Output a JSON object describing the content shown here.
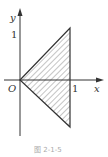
{
  "figure": {
    "axis_x_label": "x",
    "axis_y_label": "y",
    "origin_label": "O",
    "x_tick_label": "1",
    "y_tick_label": "1",
    "caption": "图 2-1-5",
    "shaded_region": {
      "shape": "triangle",
      "vertices": [
        [
          0,
          0
        ],
        [
          1,
          1
        ],
        [
          1,
          -1
        ]
      ],
      "fill": "hatched"
    },
    "colors": {
      "line": "#333333",
      "hatch": "#555555",
      "caption": "#aaaaaa"
    }
  }
}
